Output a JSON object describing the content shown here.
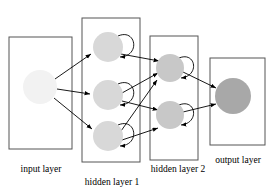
{
  "figure": {
    "type": "neural-network-diagram",
    "title": "",
    "background": "#ffffff",
    "width": 275,
    "height": 191
  },
  "palette": {
    "stroke": "#000000",
    "box_stroke": "#555555",
    "box_fill": "#ffffff",
    "input_node": "#f2f2f2",
    "hidden1_node": "#d8d8d8",
    "hidden2_node": "#c8c8c8",
    "output_node": "#a8a8a8",
    "label_color": "#000000"
  },
  "layers": [
    {
      "id": "input",
      "label": "input layer",
      "label_x": 41,
      "label_y": 172,
      "box": {
        "x": 9,
        "y": 37,
        "w": 63,
        "h": 112
      },
      "node_fill": "#f2f2f2",
      "node_r": 17,
      "nodes": [
        {
          "id": "i1",
          "cx": 40,
          "cy": 87
        }
      ],
      "recurrent": false
    },
    {
      "id": "hidden1",
      "label": "hidden layer 1",
      "label_x": 112,
      "label_y": 185,
      "box": {
        "x": 82,
        "y": 18,
        "w": 58,
        "h": 144
      },
      "node_fill": "#d8d8d8",
      "node_r": 15,
      "nodes": [
        {
          "id": "h1a",
          "cx": 108,
          "cy": 47
        },
        {
          "id": "h1b",
          "cx": 108,
          "cy": 95
        },
        {
          "id": "h1c",
          "cx": 108,
          "cy": 136
        }
      ],
      "recurrent": true
    },
    {
      "id": "hidden2",
      "label": "hidden layer 2",
      "label_x": 178,
      "label_y": 172,
      "box": {
        "x": 150,
        "y": 36,
        "w": 48,
        "h": 124
      },
      "node_fill": "#c8c8c8",
      "node_r": 14,
      "nodes": [
        {
          "id": "h2a",
          "cx": 170,
          "cy": 68
        },
        {
          "id": "h2b",
          "cx": 170,
          "cy": 115
        }
      ],
      "recurrent": true
    },
    {
      "id": "output",
      "label": "output layer",
      "label_x": 238,
      "label_y": 163,
      "box": {
        "x": 210,
        "y": 58,
        "w": 55,
        "h": 87
      },
      "node_fill": "#a8a8a8",
      "node_r": 18,
      "nodes": [
        {
          "id": "o1",
          "cx": 233,
          "cy": 96
        }
      ],
      "recurrent": false
    }
  ],
  "connections": {
    "input_to_hidden1": [
      {
        "from": "i1",
        "to": "h1a"
      },
      {
        "from": "i1",
        "to": "h1b"
      },
      {
        "from": "i1",
        "to": "h1c"
      }
    ],
    "hidden1_to_hidden2": [
      {
        "from": "h1a",
        "to": "h2a"
      },
      {
        "from": "h1b",
        "to": "h2a"
      },
      {
        "from": "h1c",
        "to": "h2a"
      },
      {
        "from": "h1b",
        "to": "h2b"
      },
      {
        "from": "h1c",
        "to": "h2b"
      }
    ],
    "hidden2_to_output": [
      {
        "from": "h2a",
        "to": "o1"
      },
      {
        "from": "h2b",
        "to": "o1"
      }
    ],
    "self_loops": [
      "h1a",
      "h1b",
      "h1c",
      "h2a",
      "h2b"
    ]
  }
}
